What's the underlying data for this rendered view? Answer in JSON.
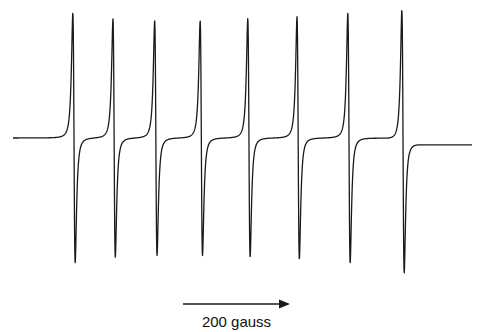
{
  "chart_data": {
    "type": "line",
    "title": "",
    "xlabel": "Magnetic field (gauss)",
    "ylabel": "dχ''/dB (arb. units)",
    "grid": false,
    "axes_visible": false,
    "x_range_gauss": [
      -120,
      780
    ],
    "y_range": [
      -1.05,
      1.05
    ],
    "baseline_left": 0.0,
    "baseline_right": -0.055,
    "lines": [
      {
        "index": 1,
        "center_gauss": 0,
        "half_width_gauss": 3.8,
        "amplitude": 1.0
      },
      {
        "index": 2,
        "center_gauss": 75,
        "half_width_gauss": 3.8,
        "amplitude": 0.955
      },
      {
        "index": 3,
        "center_gauss": 153,
        "half_width_gauss": 3.8,
        "amplitude": 0.94
      },
      {
        "index": 4,
        "center_gauss": 238,
        "half_width_gauss": 3.8,
        "amplitude": 0.94
      },
      {
        "index": 5,
        "center_gauss": 327,
        "half_width_gauss": 3.8,
        "amplitude": 0.955
      },
      {
        "index": 6,
        "center_gauss": 419,
        "half_width_gauss": 3.8,
        "amplitude": 0.97
      },
      {
        "index": 7,
        "center_gauss": 514,
        "half_width_gauss": 3.8,
        "amplitude": 1.0
      },
      {
        "index": 8,
        "center_gauss": 615,
        "half_width_gauss": 3.8,
        "amplitude": 1.05
      }
    ],
    "scale_bar": {
      "length_gauss": 200,
      "label": "200 gauss",
      "direction": "right"
    }
  },
  "colors": {
    "trace": "#1a1a1a",
    "background": "#ffffff"
  }
}
